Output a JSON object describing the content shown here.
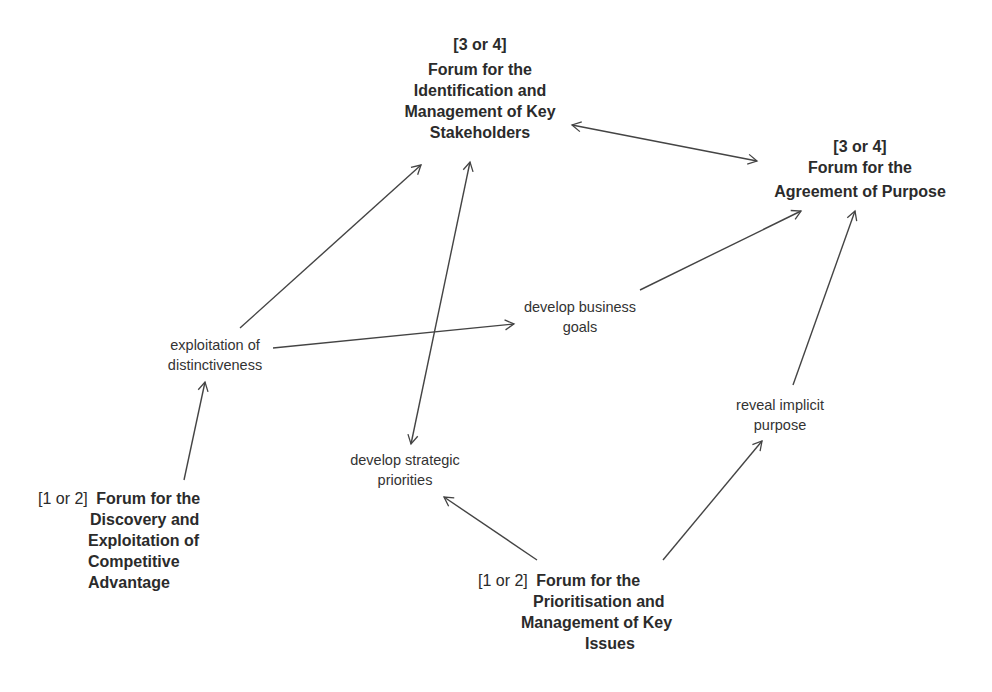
{
  "forums": {
    "stakeholders": {
      "tag": "[3 or 4]",
      "lines": [
        "Forum for the",
        "Identification and",
        "Management of Key",
        "Stakeholders"
      ]
    },
    "purpose": {
      "tag": "[3 or 4]",
      "lines": [
        "Forum for the",
        "Agreement of Purpose"
      ]
    },
    "competitive": {
      "tag": "[1 or 2]",
      "lines": [
        "Forum for the",
        "Discovery and",
        "Exploitation of",
        "Competitive",
        "Advantage"
      ]
    },
    "issues": {
      "tag": "[1 or 2]",
      "lines": [
        "Forum for the",
        "Prioritisation and",
        "Management of Key",
        "Issues"
      ]
    }
  },
  "activities": {
    "distinctiveness": [
      "exploitation of",
      "distinctiveness"
    ],
    "business_goals": [
      "develop business",
      "goals"
    ],
    "strategic_priorities": [
      "develop strategic",
      "priorities"
    ],
    "implicit_purpose": [
      "reveal implicit",
      "purpose"
    ]
  },
  "edges": [
    {
      "from": "competitive",
      "to": "distinctiveness",
      "type": "directed"
    },
    {
      "from": "distinctiveness",
      "to": "stakeholders",
      "type": "directed"
    },
    {
      "from": "distinctiveness",
      "to": "business_goals",
      "type": "directed"
    },
    {
      "from": "business_goals",
      "to": "purpose",
      "type": "directed"
    },
    {
      "from": "stakeholders",
      "to": "purpose",
      "type": "bidirectional"
    },
    {
      "from": "stakeholders",
      "to": "strategic_priorities",
      "type": "bidirectional"
    },
    {
      "from": "issues",
      "to": "strategic_priorities",
      "type": "directed"
    },
    {
      "from": "issues",
      "to": "implicit_purpose",
      "type": "directed"
    },
    {
      "from": "implicit_purpose",
      "to": "purpose",
      "type": "directed"
    }
  ],
  "colors": {
    "text": "#2b2b2b",
    "line": "#444444",
    "background": "#ffffff"
  }
}
